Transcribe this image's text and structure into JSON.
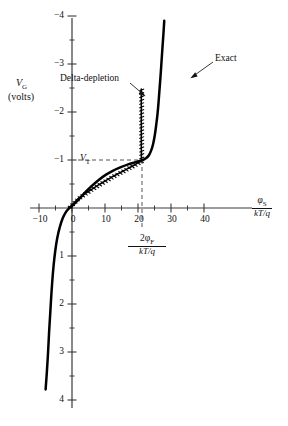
{
  "chart_data": {
    "type": "line",
    "title": "",
    "xlabel": "phi_S / (kT/q)",
    "ylabel": "V_G (volts)",
    "xlim": [
      -13,
      46
    ],
    "ylim": [
      -4.2,
      4.3
    ],
    "grid": false,
    "legend": "annotations",
    "x_ticks_major": [
      -10,
      0,
      10,
      20,
      30,
      40
    ],
    "x_tick_labels": [
      "-10",
      "0",
      "10",
      "20",
      "30",
      "40"
    ],
    "x_ticks_minor": [
      -5,
      5,
      15,
      25,
      35
    ],
    "y_ticks_major": [
      -4,
      -3,
      -2,
      -1,
      1,
      2,
      3,
      4
    ],
    "y_tick_labels": [
      "-4",
      "-3",
      "-2",
      "-1",
      "1",
      "2",
      "3",
      "4"
    ],
    "y_ticks_minor": [
      -3.5,
      -2.5,
      -1.5,
      -0.5,
      0.5,
      1.5,
      2.5,
      3.5
    ],
    "markers": {
      "threshold_voltage": {
        "label": "V_T",
        "value": 1.0
      },
      "surface_potential_inversion": {
        "label": "2phi_F/(kT/q)",
        "value": 21
      }
    },
    "series": [
      {
        "name": "Exact",
        "style": "solid-thick",
        "points": [
          [
            -8.0,
            -3.78
          ],
          [
            -7.6,
            -3.4
          ],
          [
            -7.25,
            -3.0
          ],
          [
            -6.95,
            -2.6
          ],
          [
            -6.6,
            -2.2
          ],
          [
            -6.3,
            -1.85
          ],
          [
            -5.95,
            -1.5
          ],
          [
            -5.55,
            -1.18
          ],
          [
            -5.05,
            -0.88
          ],
          [
            -4.45,
            -0.62
          ],
          [
            -3.7,
            -0.4
          ],
          [
            -2.85,
            -0.22
          ],
          [
            -1.9,
            -0.09
          ],
          [
            -0.9,
            -0.01
          ],
          [
            0.0,
            0.04
          ],
          [
            1.2,
            0.12
          ],
          [
            2.6,
            0.22
          ],
          [
            4.2,
            0.34
          ],
          [
            6.0,
            0.46
          ],
          [
            8.0,
            0.58
          ],
          [
            10.2,
            0.69
          ],
          [
            12.5,
            0.78
          ],
          [
            14.8,
            0.85
          ],
          [
            17.0,
            0.91
          ],
          [
            19.0,
            0.95
          ],
          [
            20.5,
            0.98
          ],
          [
            21.5,
            1.0
          ],
          [
            22.5,
            1.04
          ],
          [
            23.3,
            1.1
          ],
          [
            24.0,
            1.2
          ],
          [
            24.6,
            1.34
          ],
          [
            25.1,
            1.52
          ],
          [
            25.5,
            1.72
          ],
          [
            25.9,
            1.95
          ],
          [
            26.2,
            2.18
          ],
          [
            26.5,
            2.45
          ],
          [
            26.8,
            2.72
          ],
          [
            27.1,
            3.02
          ],
          [
            27.4,
            3.33
          ],
          [
            27.7,
            3.62
          ],
          [
            27.95,
            3.9
          ]
        ]
      },
      {
        "name": "Delta-depletion",
        "style": "solid-hatched",
        "points": [
          [
            -1.0,
            0.0
          ],
          [
            0.5,
            0.1
          ],
          [
            2.0,
            0.2
          ],
          [
            3.8,
            0.29
          ],
          [
            5.8,
            0.38
          ],
          [
            7.8,
            0.47
          ],
          [
            10.0,
            0.56
          ],
          [
            12.2,
            0.65
          ],
          [
            14.4,
            0.73
          ],
          [
            16.6,
            0.81
          ],
          [
            18.8,
            0.89
          ],
          [
            20.5,
            0.96
          ],
          [
            21.0,
            1.0
          ],
          [
            21.0,
            1.3
          ],
          [
            21.0,
            1.7
          ],
          [
            21.0,
            2.1
          ],
          [
            21.0,
            2.48
          ]
        ]
      }
    ],
    "annotations": [
      {
        "name": "Delta-depletion",
        "text": "Delta-depletion",
        "arrow_to": [
          21,
          2.45
        ]
      },
      {
        "name": "Exact",
        "text": "Exact",
        "arrow_to": [
          26.6,
          2.6
        ]
      }
    ]
  },
  "labels": {
    "y_axis_name": "V",
    "y_axis_sub": "G",
    "y_axis_units": "(volts)",
    "x_axis_num_sym": "φ",
    "x_axis_num_sub": "S",
    "x_axis_den": "kT/q",
    "vt_sym": "V",
    "vt_sub": "T",
    "phif_num_lead": "2φ",
    "phif_num_sub": "F",
    "phif_den": "kT/q",
    "annot_delta": "Delta-depletion",
    "annot_exact": "Exact"
  },
  "ticks": {
    "y": [
      "4",
      "3",
      "2",
      "1",
      "−1",
      "−2",
      "−3",
      "−4"
    ],
    "x": [
      "−10",
      "0",
      "10",
      "20",
      "30",
      "40"
    ]
  },
  "colors": {
    "curve": "#000000",
    "axis": "#3a3a3a",
    "dashed": "#555555",
    "background": "#ffffff",
    "text": "#111111"
  }
}
